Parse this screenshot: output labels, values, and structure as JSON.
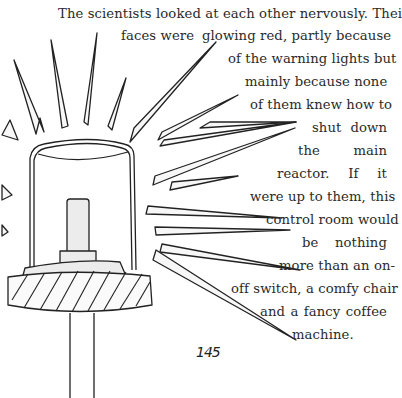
{
  "story": {
    "lines": [
      "The scientists looked at each other nervously. Their",
      "faces were",
      "glowing red, partly because",
      "of the warning lights but",
      "mainly because none",
      "of them knew how to",
      "shut down",
      "the main",
      "reactor. If it",
      "were up to them, this",
      "control room would",
      "be nothing",
      "more than an on-",
      "off switch, a comfy chair",
      "and a fancy coffee",
      "machine."
    ]
  },
  "illustration": {
    "subject": "warning-light-beacon",
    "line_color": "#222222",
    "fill_color": "#eeeeee"
  },
  "page_number": "145"
}
